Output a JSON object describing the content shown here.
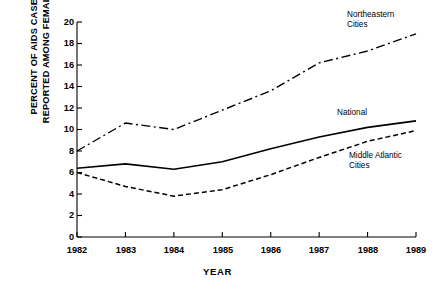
{
  "chart_data": {
    "type": "line",
    "title": "",
    "xlabel": "YEAR",
    "ylabel": "PERCENT OF AIDS CASES\nREPORTED AMONG FEMALES",
    "categories": [
      "1982",
      "1983",
      "1984",
      "1985",
      "1986",
      "1987",
      "1988",
      "1989"
    ],
    "x": [
      1982,
      1983,
      1984,
      1985,
      1986,
      1987,
      1988,
      1989
    ],
    "xlim": [
      1982,
      1989
    ],
    "ylim": [
      0,
      20
    ],
    "yticks": [
      "0",
      "2",
      "4",
      "6",
      "8",
      "10",
      "12",
      "14",
      "16",
      "18",
      "20"
    ],
    "ytick_values": [
      0,
      2,
      4,
      6,
      8,
      10,
      12,
      14,
      16,
      18,
      20
    ],
    "grid": false,
    "legend_position": "inline-annotations",
    "series": [
      {
        "name": "Northeastern Cities",
        "label": "Northeastern\nCities",
        "style": "dash-dot",
        "color": "#000000",
        "values": [
          8.0,
          10.6,
          10.0,
          11.8,
          13.6,
          16.2,
          17.3,
          18.9
        ]
      },
      {
        "name": "National",
        "label": "National",
        "style": "solid",
        "color": "#000000",
        "values": [
          6.4,
          6.8,
          6.3,
          7.0,
          8.2,
          9.3,
          10.2,
          10.8
        ]
      },
      {
        "name": "Middle Atlantic Cities",
        "label": "Middle Atlantic\nCities",
        "style": "dashed",
        "color": "#000000",
        "values": [
          6.0,
          4.7,
          3.8,
          4.4,
          5.8,
          7.4,
          8.9,
          9.9
        ]
      }
    ],
    "annotations": [
      {
        "text": "Northeastern\nCities",
        "series": "Northeastern Cities"
      },
      {
        "text": "National",
        "series": "National"
      },
      {
        "text": "Middle Atlantic\nCities",
        "series": "Middle Atlantic Cities"
      }
    ]
  }
}
